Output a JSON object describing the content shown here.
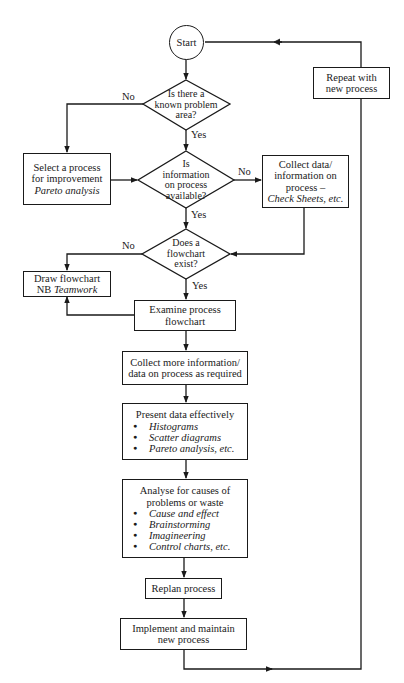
{
  "diagram": {
    "type": "flowchart",
    "start": {
      "label": "Start"
    },
    "decisions": [
      {
        "id": "d1",
        "lines": [
          "Is there a",
          "known problem",
          "area?"
        ],
        "yes": "Yes",
        "no": "No"
      },
      {
        "id": "d2",
        "lines": [
          "Is",
          "information",
          "on process",
          "available?"
        ],
        "yes": "Yes",
        "no": "No"
      },
      {
        "id": "d3",
        "lines": [
          "Does a",
          "flowchart",
          "exist?"
        ],
        "yes": "Yes",
        "no": "No"
      }
    ],
    "processes": {
      "repeat": {
        "lines": [
          "Repeat with",
          "new process"
        ]
      },
      "select": {
        "lines": [
          "Select a process",
          "for improvement"
        ],
        "italic": "Pareto analysis"
      },
      "collect_data": {
        "lines": [
          "Collect data/",
          "information on",
          "process –"
        ],
        "italic": "Check Sheets, etc."
      },
      "draw_flowchart": {
        "line": "Draw flowchart",
        "prefix": "NB ",
        "italic": "Teamwork"
      },
      "examine": {
        "lines": [
          "Examine process",
          "flowchart"
        ]
      },
      "collect_more": {
        "lines": [
          "Collect more information/",
          "data on process as required"
        ]
      },
      "present": {
        "title": "Present  data effectively",
        "bullets": [
          "Histograms",
          "Scatter diagrams",
          "Pareto analysis, etc."
        ]
      },
      "analyse": {
        "title_lines": [
          "Analyse for causes of",
          "problems or waste"
        ],
        "bullets": [
          "Cause and effect",
          "Brainstorming",
          "Imagineering",
          "Control charts, etc."
        ]
      },
      "replan": {
        "label": "Replan process"
      },
      "implement": {
        "lines": [
          "Implement and maintain",
          "new process"
        ]
      }
    },
    "edge_labels": {
      "yes": "Yes",
      "no": "No"
    },
    "colors": {
      "line": "#1a1a1a",
      "background": "#ffffff"
    }
  }
}
